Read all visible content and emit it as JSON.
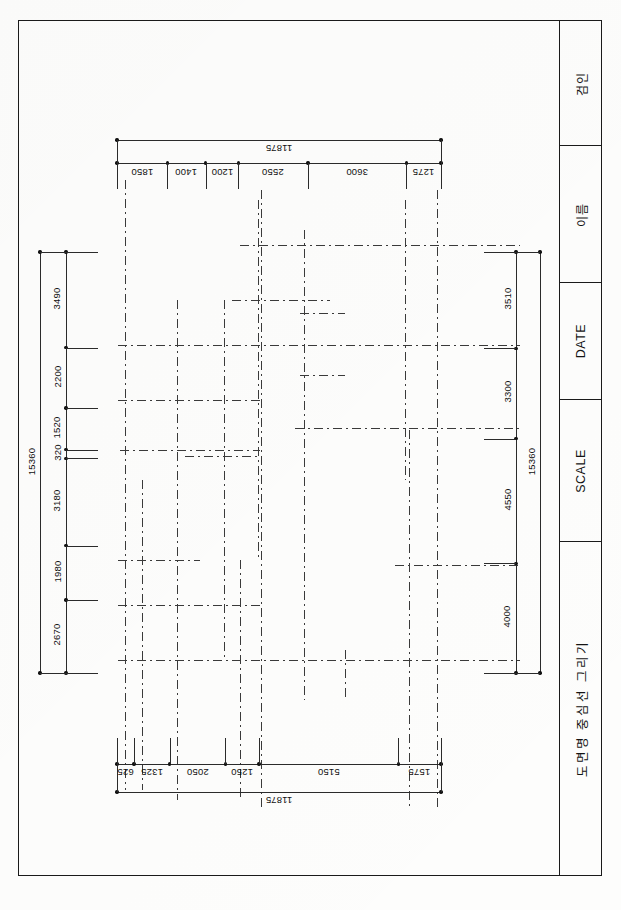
{
  "sheet": {
    "width": 621,
    "height": 910,
    "background_color": "#fdfdfc",
    "line_color": "#1a1a1a",
    "centerline_color": "#3a3a3a"
  },
  "title_block": {
    "name": "title-block",
    "cells": [
      {
        "id": "approval",
        "label": "검인",
        "top": 21,
        "height": 125
      },
      {
        "id": "name",
        "label": "이름",
        "top": 146,
        "height": 137
      },
      {
        "id": "date",
        "label": "DATE",
        "top": 283,
        "height": 117
      },
      {
        "id": "scale",
        "label": "SCALE",
        "top": 400,
        "height": 142
      },
      {
        "id": "drawing-title",
        "label": "도면명 중심선 그리기",
        "top": 542,
        "height": 333
      }
    ]
  },
  "dimensions": {
    "top_chain": {
      "name": "top-dimension-chain",
      "total": "11875",
      "segments": [
        "1850",
        "1400",
        "1200",
        "2550",
        "3600",
        "1275"
      ],
      "unit": "mm",
      "orientation": "horizontal",
      "text_rotation": 180
    },
    "bottom_chain": {
      "name": "bottom-dimension-chain",
      "total": "11875",
      "segments": [
        "625",
        "1325",
        "2050",
        "1250",
        "5150",
        "1575"
      ],
      "unit": "mm",
      "orientation": "horizontal",
      "text_rotation": 180
    },
    "left_chain": {
      "name": "left-dimension-chain",
      "total": "15360",
      "segments": [
        "3490",
        "2200",
        "1520",
        "320",
        "3180",
        "1980",
        "2670"
      ],
      "unit": "mm",
      "orientation": "vertical",
      "text_rotation": -90
    },
    "right_chain": {
      "name": "right-dimension-chain",
      "total": "15360",
      "segments": [
        "3510",
        "3300",
        "4550",
        "4000"
      ],
      "unit": "mm",
      "orientation": "vertical",
      "text_rotation": -90
    }
  },
  "plan": {
    "name": "centerline-plan",
    "description": "grid of dash-dot centerlines",
    "vertical_lines": [
      {
        "x": 125,
        "y1": 180,
        "y2": 790
      },
      {
        "x": 142,
        "y1": 480,
        "y2": 790
      },
      {
        "x": 177,
        "y1": 300,
        "y2": 800
      },
      {
        "x": 224,
        "y1": 300,
        "y2": 660
      },
      {
        "x": 240,
        "y1": 560,
        "y2": 800
      },
      {
        "x": 258,
        "y1": 200,
        "y2": 560
      },
      {
        "x": 261,
        "y1": 190,
        "y2": 810
      },
      {
        "x": 304,
        "y1": 230,
        "y2": 700
      },
      {
        "x": 345,
        "y1": 650,
        "y2": 700
      },
      {
        "x": 405,
        "y1": 200,
        "y2": 480
      },
      {
        "x": 409,
        "y1": 430,
        "y2": 810
      },
      {
        "x": 437,
        "y1": 190,
        "y2": 810
      }
    ],
    "horizontal_lines": [
      {
        "y": 245,
        "x1": 240,
        "x2": 520
      },
      {
        "y": 300,
        "x1": 232,
        "x2": 330
      },
      {
        "y": 313,
        "x1": 300,
        "x2": 345
      },
      {
        "y": 345,
        "x1": 118,
        "x2": 520
      },
      {
        "y": 375,
        "x1": 300,
        "x2": 345
      },
      {
        "y": 400,
        "x1": 118,
        "x2": 262
      },
      {
        "y": 428,
        "x1": 295,
        "x2": 520
      },
      {
        "y": 450,
        "x1": 120,
        "x2": 260
      },
      {
        "y": 456,
        "x1": 185,
        "x2": 262
      },
      {
        "y": 560,
        "x1": 118,
        "x2": 200
      },
      {
        "y": 565,
        "x1": 395,
        "x2": 520
      },
      {
        "y": 605,
        "x1": 118,
        "x2": 260
      },
      {
        "y": 660,
        "x1": 118,
        "x2": 520
      }
    ]
  }
}
